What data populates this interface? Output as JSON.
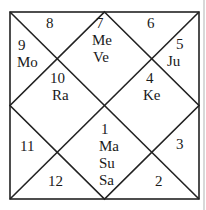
{
  "chart": {
    "style": "North Indian diamond horoscope",
    "line_color": "#222222",
    "houses": [
      {
        "house": "1",
        "planets": [
          "Ma",
          "Su",
          "Sa"
        ]
      },
      {
        "house": "2",
        "planets": []
      },
      {
        "house": "3",
        "planets": []
      },
      {
        "house": "4",
        "planets": [
          "Ke"
        ]
      },
      {
        "house": "5",
        "planets": [
          "Ju"
        ]
      },
      {
        "house": "6",
        "planets": []
      },
      {
        "house": "7",
        "planets": [
          "Me",
          "Ve"
        ]
      },
      {
        "house": "8",
        "planets": []
      },
      {
        "house": "9",
        "planets": [
          "Mo"
        ]
      },
      {
        "house": "10",
        "planets": [
          "Ra"
        ]
      },
      {
        "house": "11",
        "planets": []
      },
      {
        "house": "12",
        "planets": []
      }
    ]
  }
}
